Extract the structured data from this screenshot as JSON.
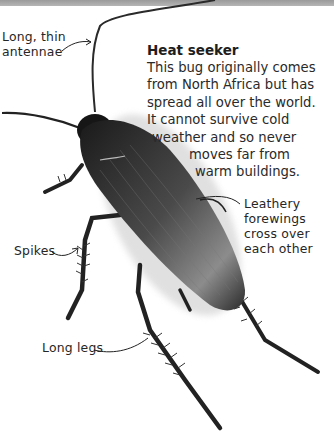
{
  "info": {
    "title": "Heat seeker",
    "lines": [
      "This bug originally comes",
      "from North Africa but has",
      "spread all over the world.",
      "It cannot survive cold",
      "weather and so never",
      "moves far from",
      "warm buildings."
    ]
  },
  "labels": {
    "antennae": [
      "Long, thin",
      "antennae"
    ],
    "forewings": [
      "Leathery",
      "forewings",
      "cross over",
      "each other"
    ],
    "spikes": "Spikes",
    "legs": "Long legs"
  },
  "subject": {
    "name": "cockroach",
    "colors": {
      "body": "#1c1c1c",
      "wing": "#3a3a3a",
      "wing_highlight": "#9a9a9a",
      "background": "#ffffff",
      "top_strip": "#a8a8a8",
      "text": "#262626"
    }
  }
}
